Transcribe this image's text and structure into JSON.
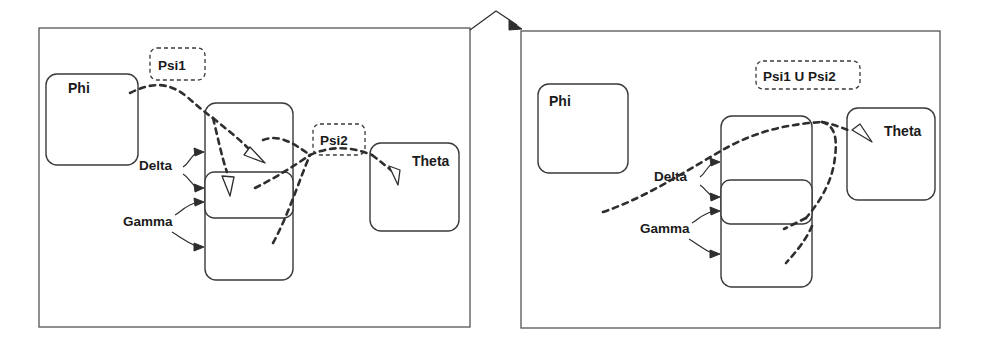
{
  "figure": {
    "panels": [
      {
        "id": "left-panel",
        "nodes": [
          {
            "name": "phi",
            "label": "Phi"
          },
          {
            "name": "theta",
            "label": "Theta"
          }
        ],
        "stack": {
          "name": "center-stack",
          "segments": [
            "top",
            "middle",
            "bottom"
          ]
        },
        "edge_labels": [
          {
            "name": "delta",
            "label": "Delta",
            "arrow_count": 2
          },
          {
            "name": "gamma",
            "label": "Gamma",
            "arrow_count": 2
          }
        ],
        "set_labels": [
          {
            "name": "psi1",
            "label": "Psi1"
          },
          {
            "name": "psi2",
            "label": "Psi2"
          }
        ]
      },
      {
        "id": "right-panel",
        "nodes": [
          {
            "name": "phi",
            "label": "Phi"
          },
          {
            "name": "theta",
            "label": "Theta"
          }
        ],
        "stack": {
          "name": "center-stack",
          "segments": [
            "top",
            "middle",
            "bottom"
          ]
        },
        "edge_labels": [
          {
            "name": "delta",
            "label": "Delta",
            "arrow_count": 2
          },
          {
            "name": "gamma",
            "label": "Gamma",
            "arrow_count": 2
          }
        ],
        "set_labels": [
          {
            "name": "psi-union",
            "label": "Psi1 U Psi2"
          }
        ]
      }
    ],
    "transition_arrow": {
      "name": "panel-transition-arrow",
      "from": "left-panel",
      "to": "right-panel"
    },
    "colors": {
      "ink": "#2e2e2e",
      "box_stroke": "#3a3a3a",
      "panel_stroke": "#555555",
      "background": "#ffffff"
    }
  }
}
